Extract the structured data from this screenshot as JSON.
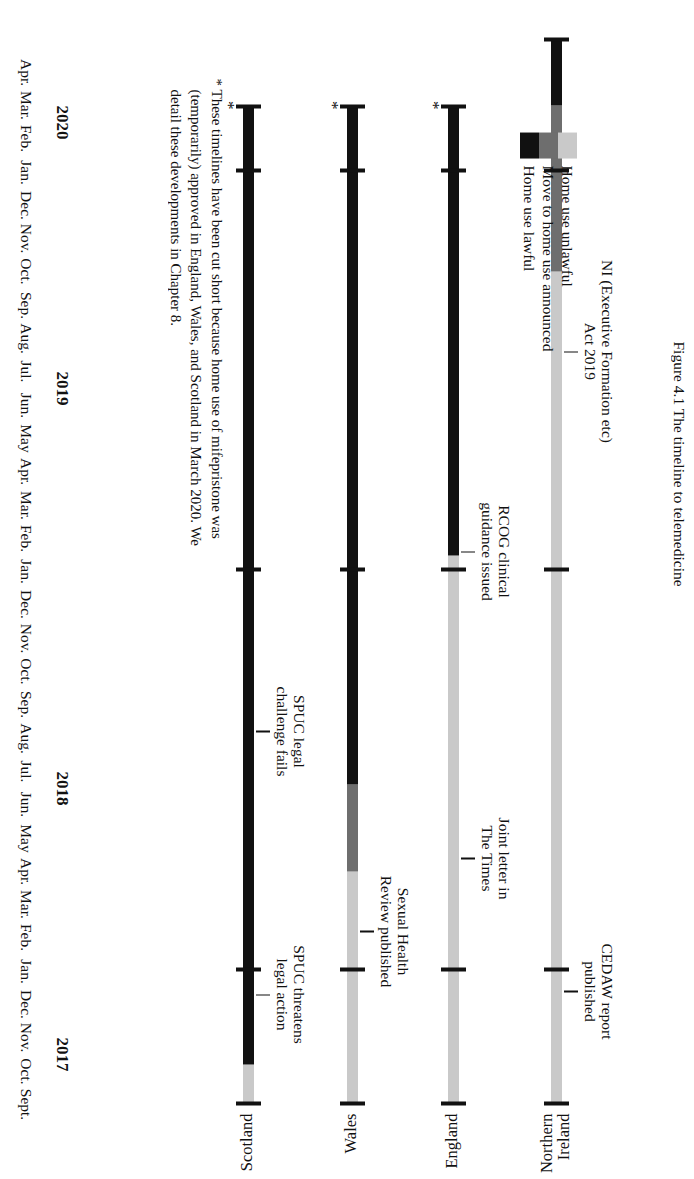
{
  "figure": {
    "caption": "Figure 4.1 The timeline to telemedicine",
    "footnote": "* These timelines have been cut short because home use of mifepristone was (temporarily) approved in England, Wales, and Scotland in March 2020. We detail these developments in Chapter 8."
  },
  "axis": {
    "months": [
      "Sept.",
      "Oct.",
      "Nov.",
      "Dec.",
      "Jan.",
      "Feb.",
      "Mar.",
      "Apr.",
      "May",
      "Jun.",
      "Jul.",
      "Aug.",
      "Sep.",
      "Oct.",
      "Nov.",
      "Dec.",
      "Jan.",
      "Feb.",
      "Mar.",
      "Apr.",
      "May",
      "Jun.",
      "Jul.",
      "Aug.",
      "Sep.",
      "Oct.",
      "Nov.",
      "Dec.",
      "Jan.",
      "Feb.",
      "Mar.",
      "Apr."
    ],
    "years": [
      {
        "label": "2017",
        "start_index": 0,
        "end_index": 3
      },
      {
        "label": "2018",
        "start_index": 4,
        "end_index": 15
      },
      {
        "label": "2019",
        "start_index": 16,
        "end_index": 27
      },
      {
        "label": "2020",
        "start_index": 28,
        "end_index": 31
      }
    ],
    "year_boundaries": [
      4,
      16,
      28
    ]
  },
  "legend": {
    "position": "bottom-right",
    "items": [
      {
        "label": "Home use unlawful",
        "color": "#c9c9c9",
        "key": "unlawful"
      },
      {
        "label": "Move to home use announced",
        "color": "#6e6e6e",
        "key": "announced"
      },
      {
        "label": "Home use lawful",
        "color": "#111111",
        "key": "lawful"
      }
    ]
  },
  "chart_data": {
    "type": "timeline",
    "title": "The timeline to telemedicine",
    "xlabel": "",
    "ylabel": "",
    "x_categories": [
      "Sept. 2017",
      "Oct. 2017",
      "Nov. 2017",
      "Dec. 2017",
      "Jan. 2018",
      "Feb. 2018",
      "Mar. 2018",
      "Apr. 2018",
      "May 2018",
      "Jun. 2018",
      "Jul. 2018",
      "Aug. 2018",
      "Sep. 2018",
      "Oct. 2018",
      "Nov. 2018",
      "Dec. 2018",
      "Jan. 2019",
      "Feb. 2019",
      "Mar. 2019",
      "Apr. 2019",
      "May 2019",
      "Jun. 2019",
      "Jul. 2019",
      "Aug. 2019",
      "Sep. 2019",
      "Oct. 2019",
      "Nov. 2019",
      "Dec. 2019",
      "Jan. 2020",
      "Feb. 2020",
      "Mar. 2020",
      "Apr. 2020"
    ],
    "xlim": [
      "Sept. 2017",
      "Apr. 2020"
    ],
    "grid": false,
    "states": [
      "unlawful",
      "announced",
      "lawful"
    ],
    "series": [
      {
        "name": "Scotland",
        "end_marker": "*",
        "segments": [
          {
            "state": "unlawful",
            "from_index": 0,
            "to_index": 1.2
          },
          {
            "state": "lawful",
            "from_index": 1.2,
            "to_index": 30
          }
        ]
      },
      {
        "name": "Wales",
        "end_marker": "*",
        "segments": [
          {
            "state": "unlawful",
            "from_index": 0,
            "to_index": 7.0
          },
          {
            "state": "announced",
            "from_index": 7.0,
            "to_index": 9.6
          },
          {
            "state": "lawful",
            "from_index": 9.6,
            "to_index": 30
          }
        ]
      },
      {
        "name": "England",
        "end_marker": "*",
        "segments": [
          {
            "state": "unlawful",
            "from_index": 0,
            "to_index": 16.5
          },
          {
            "state": "lawful",
            "from_index": 16.5,
            "to_index": 30
          }
        ]
      },
      {
        "name": "Northern\nIreland",
        "end_marker": "",
        "segments": [
          {
            "state": "unlawful",
            "from_index": 0,
            "to_index": 25.0
          },
          {
            "state": "announced",
            "from_index": 25.0,
            "to_index": 30.0
          },
          {
            "state": "lawful",
            "from_index": 30.0,
            "to_index": 32
          }
        ]
      }
    ],
    "annotations": [
      {
        "series": "Scotland",
        "text": "SPUC threatens\nlegal action",
        "at_index": 3.3
      },
      {
        "series": "Scotland",
        "text": "SPUC legal\nchallenge fails",
        "at_index": 11.2
      },
      {
        "series": "Wales",
        "text": "Sexual Health\nReview published",
        "at_index": 5.2
      },
      {
        "series": "England",
        "text": "Joint letter in\nThe Times",
        "at_index": 7.4
      },
      {
        "series": "England",
        "text": "RCOG clinical\nguidance issued",
        "at_index": 16.6
      },
      {
        "series": "Northern Ireland",
        "text": "CEDAW report\npublished",
        "at_index": 3.4
      },
      {
        "series": "Northern Ireland",
        "text": "NI (Executive Formation etc)\nAct 2019",
        "at_index": 22.6
      }
    ]
  }
}
